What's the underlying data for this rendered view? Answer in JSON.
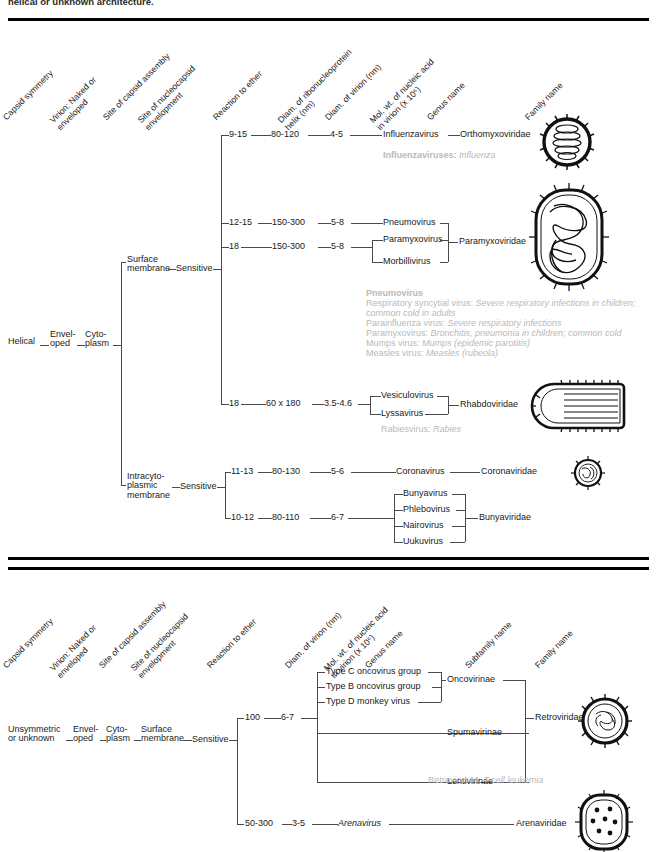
{
  "caption_clipped": "helical or unknown architecture.",
  "columns_top": [
    "Capsid symmetry",
    "Virion: Naked or enveloped",
    "Site of capsid assembly",
    "Site of nucleocapsid envelopment",
    "Reaction to ether",
    "Diam. of ribonucleoprotein helix (nm)",
    "Diam. of virion (nm)",
    "Mol. wt. of nucleic acid in virion (x 10⁶)",
    "Genus name",
    "Family name"
  ],
  "columns_bottom": [
    "Capsid symmetry",
    "Virion: Naked or enveloped",
    "Site of capsid assembly",
    "Site of nucleocapsid envelopment",
    "Reaction to ether",
    "Diam. of virion (nm)",
    "Mol. wt. of nucleic acid in virion (x 10⁶)",
    "Genus name",
    "Subfamily name",
    "Family name"
  ],
  "top_section": {
    "capsid_symmetry": "Helical",
    "virion": "Envel-\noped",
    "assembly_site": "Cyto-\nplasm",
    "envelopment_sites": [
      {
        "label": "Surface\nmembrane",
        "ether": "Sensitive"
      },
      {
        "label": "Intracyto-\nplasmic\nmembrane",
        "ether": "Sensitive"
      }
    ],
    "rows": [
      {
        "helix": "9-15",
        "virion_diam": "80-120",
        "mol_wt": "4-5",
        "genera": [
          "Influenzavirus"
        ],
        "family": "Orthomyxoviridae"
      },
      {
        "helix": "12-15",
        "virion_diam": "150-300",
        "mol_wt": "5-8",
        "genera": [
          "Pneumovirus"
        ],
        "family": "Paramyxoviridae"
      },
      {
        "helix": "18",
        "virion_diam": "150-300",
        "mol_wt": "5-8",
        "genera": [
          "Paramyxovirus",
          "Morbillivirus"
        ],
        "family": ""
      },
      {
        "helix": "18",
        "virion_diam": "60 x 180",
        "mol_wt": "3.5-4.6",
        "genera": [
          "Vesiculovirus",
          "Lyssavirus"
        ],
        "family": "Rhabdoviridae"
      },
      {
        "helix": "11-13",
        "virion_diam": "80-130",
        "mol_wt": "5-6",
        "genera": [
          "Coronavirus"
        ],
        "family": "Coronaviridae"
      },
      {
        "helix": "10-12",
        "virion_diam": "80-110",
        "mol_wt": "6-7",
        "genera": [
          "Bunyavirus",
          "Phlebovirus",
          "Nairovirus",
          "Uukuvirus"
        ],
        "family": "Bunyaviridae"
      }
    ],
    "notes": {
      "influenza": {
        "agent": "Influenzaviruses:",
        "disease": "Influenza"
      },
      "pneumovirus_title": "Pneumovirus",
      "pneumovirus_lines": [
        {
          "agent": "Respiratory syncytial virus:",
          "disease": "Severe respiratory infections in children;"
        },
        {
          "agent": "",
          "disease": "common cold in adults"
        },
        {
          "agent": "Parainfluenza virus:",
          "disease": "Severe respiratory infections"
        },
        {
          "agent": "Paramyxovirus:",
          "disease": "Bronchitis, pneumonia in children; common cold"
        },
        {
          "agent": "Mumps virus:",
          "disease": "Mumps (epidemic parotitis)"
        },
        {
          "agent": "Measles virus:",
          "disease": "Measles (rubeola)"
        }
      ],
      "rabies": {
        "agent": "Rabiesvirus:",
        "disease": "Rabies"
      }
    }
  },
  "bottom_section": {
    "capsid_symmetry": "Unsymmetric\nor unknown",
    "virion": "Envel-\noped",
    "assembly_site": "Cyto-\nplasm",
    "envelopment_site": "Surface\nmembrane",
    "ether": "Sensitive",
    "rows": [
      {
        "virion_diam": "100",
        "mol_wt": "6-7",
        "genera": [
          "Type C oncovirus group",
          "Type B oncovirus group",
          "Type D monkey virus"
        ],
        "subfamilies": [
          "Oncovirinae",
          "Spumavirinae",
          "Lentivirinae"
        ],
        "family": "Retroviridae"
      },
      {
        "virion_diam": "50-300",
        "mol_wt": "3-5",
        "genera": [
          "Arenavirus"
        ],
        "subfamilies": [],
        "family": "Arenaviridae"
      }
    ],
    "notes": {
      "retro": {
        "agent": "Retroviruses:",
        "disease": "T-cell leukemia"
      }
    }
  },
  "icons": [
    {
      "name": "orthomyxovirus-virion-icon",
      "shape": "coiled-sphere"
    },
    {
      "name": "paramyxovirus-virion-icon",
      "shape": "tangled-large"
    },
    {
      "name": "rhabdovirus-virion-icon",
      "shape": "bullet"
    },
    {
      "name": "coronavirus-virion-icon",
      "shape": "small-crowned"
    },
    {
      "name": "retrovirus-virion-icon",
      "shape": "cored-sphere"
    },
    {
      "name": "arenavirus-virion-icon",
      "shape": "granular-oval"
    }
  ],
  "colors": {
    "ink": "#1a1a1a",
    "line": "#4a4a4a",
    "note": "#b9b9b9",
    "rule": "#000000"
  }
}
